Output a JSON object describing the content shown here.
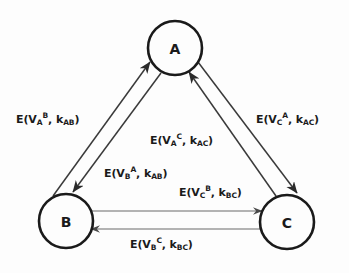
{
  "diagram": {
    "type": "directed-graph",
    "background_color": "#fdfdfd",
    "stroke_color": "#1a1a1a",
    "nodes": [
      {
        "id": "A",
        "label": "A",
        "cx": 175,
        "cy": 48,
        "r": 27
      },
      {
        "id": "B",
        "label": "B",
        "cx": 66,
        "cy": 221,
        "r": 27
      },
      {
        "id": "C",
        "label": "C",
        "cx": 287,
        "cy": 222,
        "r": 27
      }
    ],
    "edges": [
      {
        "id": "b-to-a",
        "from": "B",
        "to": "A",
        "label_plain": "E(V_A^B, k_AB)",
        "label": {
          "prefix": "E(V",
          "base": "A",
          "sup": "B",
          "mid": ", k",
          "ksub": "AB",
          "suffix": ")"
        },
        "label_x": 16,
        "label_y": 113
      },
      {
        "id": "a-to-b",
        "from": "A",
        "to": "B",
        "label_plain": "E(V_B^A, k_AB)",
        "label": {
          "prefix": "E(V",
          "base": "B",
          "sup": "A",
          "mid": ", k",
          "ksub": "AB",
          "suffix": ")"
        },
        "label_x": 104,
        "label_y": 167
      },
      {
        "id": "c-to-a",
        "from": "C",
        "to": "A",
        "label_plain": "E(V_C^A, k_AC)",
        "label": {
          "prefix": "E(V",
          "base": "C",
          "sup": "A",
          "mid": ", k",
          "ksub": "AC",
          "suffix": ")"
        },
        "label_x": 256,
        "label_y": 113
      },
      {
        "id": "a-to-c",
        "from": "A",
        "to": "C",
        "label_plain": "E(V_A^C, k_AC)",
        "label": {
          "prefix": "E(V",
          "base": "A",
          "sup": "C",
          "mid": ", k",
          "ksub": "AC",
          "suffix": ")"
        },
        "label_x": 150,
        "label_y": 134
      },
      {
        "id": "b-to-c",
        "from": "B",
        "to": "C",
        "label_plain": "E(V_C^B, k_BC)",
        "label": {
          "prefix": "E(V",
          "base": "C",
          "sup": "B",
          "mid": ", k",
          "ksub": "BC",
          "suffix": ")"
        },
        "label_x": 179,
        "label_y": 186
      },
      {
        "id": "c-to-b",
        "from": "C",
        "to": "B",
        "label_plain": "E(V_B^C, k_BC)",
        "label": {
          "prefix": "E(V",
          "base": "B",
          "sup": "C",
          "mid": ", k",
          "ksub": "BC",
          "suffix": ")"
        },
        "label_x": 130,
        "label_y": 238
      }
    ]
  }
}
